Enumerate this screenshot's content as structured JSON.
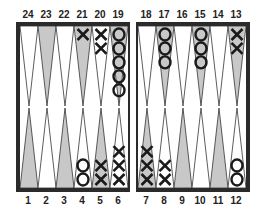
{
  "board": {
    "title": "Backgammon board",
    "colors": {
      "frame": "#2a2a2a",
      "shaded_point": "#c8c8c8",
      "plain_point": "#ffffff",
      "checker_stroke": "#1a1a1a"
    },
    "top_labels": [
      "24",
      "23",
      "22",
      "21",
      "20",
      "19",
      "18",
      "17",
      "16",
      "15",
      "14",
      "13"
    ],
    "bottom_labels": [
      "1",
      "2",
      "3",
      "4",
      "5",
      "6",
      "7",
      "8",
      "9",
      "10",
      "11",
      "12"
    ],
    "points": [
      {
        "point": 24,
        "shaded": false,
        "checkers": 0,
        "player": ""
      },
      {
        "point": 23,
        "shaded": true,
        "checkers": 0,
        "player": ""
      },
      {
        "point": 22,
        "shaded": false,
        "checkers": 0,
        "player": ""
      },
      {
        "point": 21,
        "shaded": true,
        "checkers": 1,
        "player": "X"
      },
      {
        "point": 20,
        "shaded": false,
        "checkers": 2,
        "player": "X"
      },
      {
        "point": 19,
        "shaded": true,
        "checkers": 5,
        "player": "O"
      },
      {
        "point": 18,
        "shaded": false,
        "checkers": 0,
        "player": ""
      },
      {
        "point": 17,
        "shaded": true,
        "checkers": 3,
        "player": "O"
      },
      {
        "point": 16,
        "shaded": false,
        "checkers": 0,
        "player": ""
      },
      {
        "point": 15,
        "shaded": true,
        "checkers": 3,
        "player": "O"
      },
      {
        "point": 14,
        "shaded": false,
        "checkers": 0,
        "player": ""
      },
      {
        "point": 13,
        "shaded": true,
        "checkers": 2,
        "player": "X"
      },
      {
        "point": 1,
        "shaded": true,
        "checkers": 0,
        "player": ""
      },
      {
        "point": 2,
        "shaded": false,
        "checkers": 0,
        "player": ""
      },
      {
        "point": 3,
        "shaded": true,
        "checkers": 0,
        "player": ""
      },
      {
        "point": 4,
        "shaded": false,
        "checkers": 2,
        "player": "O"
      },
      {
        "point": 5,
        "shaded": true,
        "checkers": 2,
        "player": "X"
      },
      {
        "point": 6,
        "shaded": false,
        "checkers": 3,
        "player": "X"
      },
      {
        "point": 7,
        "shaded": true,
        "checkers": 3,
        "player": "X"
      },
      {
        "point": 8,
        "shaded": false,
        "checkers": 2,
        "player": "X"
      },
      {
        "point": 9,
        "shaded": true,
        "checkers": 0,
        "player": ""
      },
      {
        "point": 10,
        "shaded": false,
        "checkers": 0,
        "player": ""
      },
      {
        "point": 11,
        "shaded": true,
        "checkers": 0,
        "player": ""
      },
      {
        "point": 12,
        "shaded": false,
        "checkers": 2,
        "player": "O"
      }
    ]
  }
}
